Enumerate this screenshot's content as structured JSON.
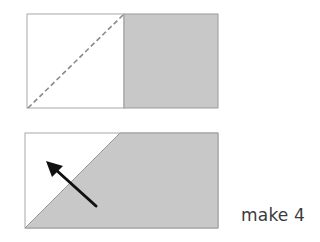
{
  "diagram": {
    "type": "quilt-block-instruction",
    "colors": {
      "fabric_gray": "#c8c8c8",
      "outline": "#9a9a9a",
      "dashed_line": "#8a8a8a",
      "arrow": "#111111",
      "background": "#ffffff",
      "text": "#3a3a3a"
    },
    "step1": {
      "description": "White square beside gray square with dashed diagonal sew line across white square",
      "left_square": "white",
      "right_square": "gray",
      "guide_line": "dashed diagonal from bottom-left to top-right"
    },
    "step2": {
      "description": "Stitched and pressed unit: white triangle top-left, gray covers remainder; arrow indicates pressing direction toward corner",
      "arrow_direction": "up-left"
    },
    "caption": "make 4"
  }
}
